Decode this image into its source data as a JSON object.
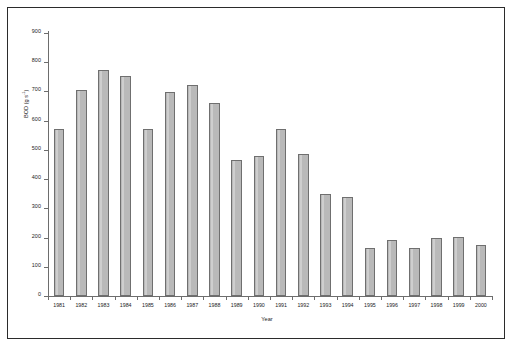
{
  "chart_data": {
    "type": "bar",
    "title": "",
    "xlabel": "Year",
    "ylabel": "BOD (g s-1)",
    "ylabel_base": "BOD (g s",
    "ylabel_exponent": "-1",
    "ylabel_close": ")",
    "categories": [
      "1981",
      "1982",
      "1983",
      "1984",
      "1985",
      "1986",
      "1987",
      "1988",
      "1989",
      "1990",
      "1991",
      "1992",
      "1993",
      "1994",
      "1995",
      "1996",
      "1997",
      "1998",
      "1999",
      "2000"
    ],
    "values": [
      572,
      705,
      775,
      752,
      572,
      698,
      722,
      660,
      465,
      478,
      572,
      485,
      348,
      340,
      163,
      192,
      165,
      200,
      202,
      175
    ],
    "ylim": [
      0,
      900
    ],
    "yticks": [
      0,
      100,
      200,
      300,
      400,
      500,
      600,
      700,
      800,
      900
    ],
    "ytick_labels": [
      "0",
      "100",
      "200",
      "300",
      "400",
      "500",
      "600",
      "700",
      "800",
      "900"
    ],
    "grid": false,
    "legend": "none",
    "series": [
      {
        "name": "BOD",
        "values": [
          572,
          705,
          775,
          752,
          572,
          698,
          722,
          660,
          465,
          478,
          572,
          485,
          348,
          340,
          163,
          192,
          165,
          200,
          202,
          175
        ]
      }
    ],
    "bar_fill_color": "#b9b9b9",
    "bar_border_color": "#6f6f6f",
    "axis_color": "#6d6d6d",
    "frame_color": "#2b2b2b",
    "background_color": "#ffffff"
  }
}
